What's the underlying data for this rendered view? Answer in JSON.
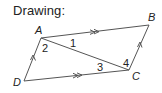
{
  "title": "Drawing:",
  "diagram": {
    "vertices": [
      {
        "name": "A",
        "x": 41,
        "y": 38,
        "label_x": 35,
        "label_y": 34
      },
      {
        "name": "B",
        "x": 149,
        "y": 25,
        "label_x": 148,
        "label_y": 21
      },
      {
        "name": "C",
        "x": 129,
        "y": 70,
        "label_x": 132,
        "label_y": 80
      },
      {
        "name": "D",
        "x": 24,
        "y": 81,
        "label_x": 13,
        "label_y": 86
      }
    ],
    "angle_labels": [
      {
        "text": "1",
        "x": 70,
        "y": 47
      },
      {
        "text": "2",
        "x": 42,
        "y": 52
      },
      {
        "text": "3",
        "x": 97,
        "y": 71
      },
      {
        "text": "4",
        "x": 123,
        "y": 67
      }
    ],
    "segments": [
      "AB",
      "BC",
      "CD",
      "DA",
      "AC"
    ],
    "parallel_marks": {
      "AB": "double-arrow",
      "DC": "double-arrow",
      "DA": "single-arrow",
      "CB": "single-arrow"
    },
    "stroke_color": "#555555",
    "text_color": "#222222"
  }
}
